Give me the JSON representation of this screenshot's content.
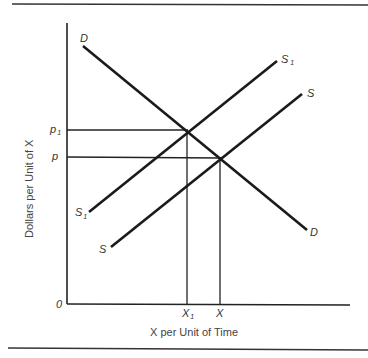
{
  "diagram": {
    "type": "supply-demand",
    "y_axis_title": "Dollars per Unit of X",
    "x_axis_title": "X per Unit of Time",
    "origin_label": "0",
    "curves": {
      "demand": {
        "label": "D",
        "label_end": "D"
      },
      "supply_original": {
        "label": "S",
        "label_end": "S"
      },
      "supply_shifted": {
        "label": "S",
        "subscript": "1",
        "label_end": "S",
        "subscript_end": "1"
      }
    },
    "price_levels": [
      {
        "label": "p",
        "subscript": "1",
        "meaning": "new equilibrium price"
      },
      {
        "label": "p",
        "subscript": "",
        "meaning": "original equilibrium price"
      }
    ],
    "quantity_levels": [
      {
        "label": "X",
        "subscript": "1",
        "meaning": "new equilibrium quantity"
      },
      {
        "label": "X",
        "subscript": "",
        "meaning": "original equilibrium quantity"
      }
    ]
  }
}
